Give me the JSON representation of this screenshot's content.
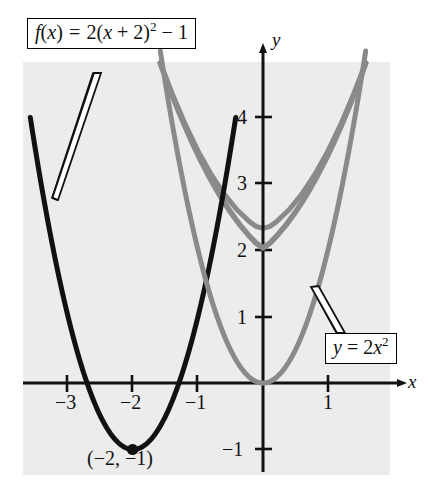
{
  "figure": {
    "type": "coordinate-graph",
    "background_color": "#ececec",
    "page_color": "#ffffff"
  },
  "axes": {
    "x_axis_label": "x",
    "y_axis_label": "y",
    "origin_px": [
      263,
      383
    ],
    "unit_px": {
      "x": 65,
      "y": 66.5
    },
    "x_range": [
      -3.7,
      2.0
    ],
    "y_range": [
      -1.4,
      4.8
    ],
    "x_ticks": [
      {
        "value": -3,
        "label": "−3",
        "x_px": 67
      },
      {
        "value": -2,
        "label": "−2",
        "x_px": 132
      },
      {
        "value": -1,
        "label": "−1",
        "x_px": 197
      },
      {
        "value": 1,
        "label": "1",
        "x_px": 328
      }
    ],
    "y_ticks": [
      {
        "value": 4,
        "label": "4",
        "y_px": 117
      },
      {
        "value": 3,
        "label": "3",
        "y_px": 183
      },
      {
        "value": 2,
        "label": "2",
        "y_px": 250
      },
      {
        "value": 1,
        "label": "1",
        "y_px": 317
      },
      {
        "value": -1,
        "label": "−1",
        "y_px": 449
      }
    ],
    "axis_color": "#111111",
    "arrowheads": [
      "x-positive",
      "y-positive"
    ]
  },
  "labels": {
    "f_box": {
      "text": "f(x) = 2(x + 2)² − 1",
      "parts": {
        "fn": "f",
        "open": "(",
        "var": "x",
        "close": ")",
        "eq": "=",
        "coef": "2(",
        "inner_var": "x",
        "plus": "+",
        "shift": "2)",
        "power": "2",
        "minus": "−",
        "const": "1"
      }
    },
    "y_box": {
      "text": "y = 2x²",
      "parts": {
        "var": "y",
        "eq": "=",
        "coef": "2",
        "x": "x",
        "power": "2"
      }
    },
    "vertex": {
      "text": "(−2, −1)",
      "point": [
        -2,
        -1
      ],
      "point_px": [
        132,
        450
      ]
    }
  },
  "chart_data": {
    "type": "line",
    "title": "",
    "xlabel": "x",
    "ylabel": "y",
    "xlim": [
      -3.7,
      2.0
    ],
    "ylim": [
      -1.4,
      4.8
    ],
    "grid": false,
    "legend": "inline-callout-boxes",
    "series": [
      {
        "name": "f(x) = 2(x + 2)² − 1",
        "equation": "y = 2*(x+2)^2 - 1",
        "color": "#111111",
        "linewidth": 5,
        "vertex": [
          -2,
          -1
        ],
        "x_domain": [
          -3.58,
          -0.42
        ],
        "points": [
          [
            -3.58,
            3.996
          ],
          [
            -3.4,
            2.92
          ],
          [
            -3.2,
            1.88
          ],
          [
            -3.0,
            1.0
          ],
          [
            -2.8,
            0.28
          ],
          [
            -2.6,
            -0.28
          ],
          [
            -2.4,
            -0.68
          ],
          [
            -2.2,
            -0.92
          ],
          [
            -2.0,
            -1.0
          ],
          [
            -1.8,
            -0.92
          ],
          [
            -1.6,
            -0.68
          ],
          [
            -1.4,
            -0.28
          ],
          [
            -1.2,
            0.28
          ],
          [
            -1.0,
            1.0
          ],
          [
            -0.8,
            1.88
          ],
          [
            -0.6,
            2.92
          ],
          [
            -0.42,
            3.996
          ]
        ],
        "marker": {
          "at": [
            -2,
            -1
          ],
          "style": "filled-circle",
          "label": "(−2, −1)"
        }
      },
      {
        "name": "y = 2x²",
        "equation": "y = 2*x^2",
        "color": "#8a8a8a",
        "linewidth": 5,
        "vertex": [
          0,
          0
        ],
        "x_domain": [
          -1.58,
          1.58
        ],
        "points": [
          [
            -1.58,
            4.99
          ],
          [
            -1.4,
            3.92
          ],
          [
            -1.2,
            2.88
          ],
          [
            -1.0,
            2.0
          ],
          [
            -0.8,
            1.28
          ],
          [
            -0.6,
            0.72
          ],
          [
            -0.4,
            0.32
          ],
          [
            -0.2,
            0.08
          ],
          [
            0.0,
            0.0
          ],
          [
            0.2,
            0.08
          ],
          [
            0.4,
            0.32
          ],
          [
            0.6,
            0.72
          ],
          [
            0.8,
            1.28
          ],
          [
            1.0,
            2.0
          ],
          [
            1.2,
            2.88
          ],
          [
            1.4,
            3.92
          ],
          [
            1.58,
            4.99
          ]
        ]
      }
    ],
    "annotations": [
      {
        "text": "f(x) = 2(x + 2)² − 1",
        "type": "callout-box",
        "box_px": [
          27,
          18
        ],
        "points_to_px": [
          58,
          200
        ]
      },
      {
        "text": "y = 2x²",
        "type": "callout-box",
        "box_px": [
          325,
          333
        ],
        "points_to_px": [
          312,
          288
        ]
      },
      {
        "text": "(−2, −1)",
        "type": "point-label",
        "at_px": [
          87,
          448
        ]
      }
    ]
  }
}
